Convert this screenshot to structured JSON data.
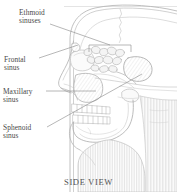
{
  "figure": {
    "title_caption": "SIDE VIEW",
    "background_color": "#ffffff",
    "ink_color": "#8c8c8c",
    "shade_color": "#b9b9b9",
    "label_color": "#4a4a4a",
    "labels": [
      {
        "id": "ethmoid",
        "line1": "Ethmoid",
        "line2": "sinuses",
        "x": 19,
        "y": 9,
        "leader_from": [
          62,
          23
        ],
        "leader_to": [
          92,
          46
        ]
      },
      {
        "id": "frontal",
        "line1": "Frontal",
        "line2": "sinus",
        "x": 4,
        "y": 56,
        "leader_from": [
          39,
          58
        ],
        "leader_to": [
          78,
          44
        ]
      },
      {
        "id": "maxillary",
        "line1": "Maxillary",
        "line2": "sinus",
        "x": 3,
        "y": 88,
        "leader_from": [
          46,
          91
        ],
        "leader_to": [
          96,
          91
        ]
      },
      {
        "id": "sphenoid",
        "line1": "Sphenoid",
        "line2": "sinus",
        "x": 3,
        "y": 124,
        "leader_from": [
          47,
          127
        ],
        "leader_to": [
          140,
          76
        ]
      }
    ],
    "bracket": {
      "id": "ethmoid-bracket",
      "x": 89,
      "y": 45,
      "width": 42,
      "height": 7
    }
  }
}
